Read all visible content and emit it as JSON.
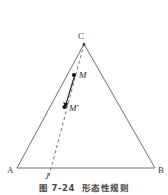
{
  "figure": {
    "caption_number": "图 7-24",
    "caption_title": "形态性规则",
    "colors": {
      "triangle_stroke": "#5f5f5f",
      "dashed_stroke": "#6a6a6a",
      "arrow_stroke": "#1c1c1c",
      "point_fill": "#111111",
      "label_color": "#3a3a3a",
      "background": "#ffffff"
    }
  },
  "diagram": {
    "type": "geometry-triangle",
    "vertices": [
      {
        "id": "A",
        "label": "A",
        "x": 17,
        "y": 168
      },
      {
        "id": "B",
        "label": "B",
        "x": 155,
        "y": 168
      },
      {
        "id": "C",
        "label": "C",
        "x": 84,
        "y": 44
      }
    ],
    "base_line": {
      "from": "A",
      "to": "B"
    },
    "dashed_line": {
      "label": "C-to-J",
      "from": {
        "x": 84,
        "y": 44
      },
      "to": {
        "x": 49,
        "y": 175
      },
      "style": "dashed"
    },
    "foot_point": {
      "id": "J",
      "label": "J",
      "x": 49,
      "y": 168
    },
    "points": [
      {
        "id": "M",
        "label": "M",
        "x": 74,
        "y": 75
      },
      {
        "id": "Mprime",
        "label": "M'",
        "x": 65,
        "y": 107
      }
    ],
    "arrow": {
      "label": "M-to-M-prime",
      "from": {
        "x": 74,
        "y": 75
      },
      "to": {
        "x": 65,
        "y": 107
      },
      "style": "solid-arrow"
    }
  }
}
